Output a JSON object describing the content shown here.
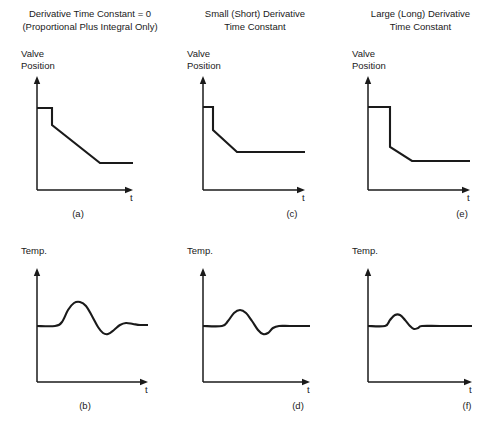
{
  "figure": {
    "caption_style": "control-system derivative action comparison",
    "columns": [
      {
        "id": "col-1",
        "title": "Derivative Time Constant = 0\n(Proportional Plus Integral Only)",
        "title_x": 10,
        "title_y": 8,
        "title_w": 160,
        "panels": [
          "a",
          "b"
        ]
      },
      {
        "id": "col-2",
        "title": "Small (Short) Derivative\nTime Constant",
        "title_x": 185,
        "title_y": 8,
        "title_w": 140,
        "panels": [
          "c",
          "d"
        ]
      },
      {
        "id": "col-3",
        "title": "Large (Long) Derivative\nTime Constant",
        "title_x": 348,
        "title_y": 8,
        "title_w": 145,
        "panels": [
          "e",
          "f"
        ]
      }
    ],
    "y_axis_labels": {
      "valve": "Valve\nPosition",
      "temp": "Temp."
    },
    "x_axis_label": "t",
    "panel_labels": {
      "a": "(a)",
      "b": "(b)",
      "c": "(c)",
      "d": "(d)",
      "e": "(e)",
      "f": "(f)"
    }
  },
  "chart_data": {
    "type": "line",
    "xlabel": "t",
    "grid": false,
    "legend": false,
    "panels": [
      {
        "key": "a",
        "label": "(a)",
        "column": 1,
        "row": 1,
        "ylabel": "Valve Position",
        "description": "Step then linear ramp down to new steady level (proportional plus integral only)",
        "origin": [
          37,
          190
        ],
        "y_axis_top": 76,
        "x_axis_right": 133,
        "points": [
          [
            37,
            108
          ],
          [
            52,
            108
          ],
          [
            52,
            125
          ],
          [
            100,
            163
          ],
          [
            133,
            163
          ]
        ]
      },
      {
        "key": "b",
        "label": "(b)",
        "column": 1,
        "row": 2,
        "ylabel": "Temp.",
        "description": "Large damped oscillation with pronounced overshoot and visible second cycle",
        "origin": [
          37,
          382
        ],
        "y_axis_top": 268,
        "x_axis_right": 148,
        "baseline_y": 326,
        "points": [
          [
            37,
            326
          ],
          [
            55,
            326
          ],
          [
            62,
            322
          ],
          [
            68,
            310
          ],
          [
            74,
            303
          ],
          [
            80,
            302
          ],
          [
            86,
            306
          ],
          [
            92,
            316
          ],
          [
            98,
            327
          ],
          [
            103,
            333
          ],
          [
            108,
            334
          ],
          [
            114,
            330
          ],
          [
            120,
            325
          ],
          [
            126,
            323
          ],
          [
            133,
            324
          ],
          [
            140,
            325
          ],
          [
            148,
            325
          ]
        ]
      },
      {
        "key": "c",
        "label": "(c)",
        "column": 2,
        "row": 1,
        "ylabel": "Valve Position",
        "description": "Step with steeper initial derivative kick then ramp to steady level",
        "origin": [
          203,
          190
        ],
        "y_axis_top": 76,
        "x_axis_right": 305,
        "points": [
          [
            203,
            107
          ],
          [
            213,
            107
          ],
          [
            213,
            130
          ],
          [
            237,
            152
          ],
          [
            305,
            152
          ]
        ]
      },
      {
        "key": "d",
        "label": "(d)",
        "column": 2,
        "row": 2,
        "ylabel": "Temp.",
        "description": "Moderate damped oscillation, smaller overshoot, settles quickly",
        "origin": [
          203,
          382
        ],
        "y_axis_top": 268,
        "x_axis_right": 310,
        "baseline_y": 326,
        "points": [
          [
            203,
            326
          ],
          [
            222,
            326
          ],
          [
            228,
            321
          ],
          [
            234,
            313
          ],
          [
            240,
            310
          ],
          [
            246,
            313
          ],
          [
            252,
            321
          ],
          [
            258,
            330
          ],
          [
            263,
            334
          ],
          [
            268,
            333
          ],
          [
            273,
            328
          ],
          [
            279,
            326
          ],
          [
            290,
            326
          ],
          [
            310,
            326
          ]
        ]
      },
      {
        "key": "e",
        "label": "(e)",
        "column": 3,
        "row": 1,
        "ylabel": "Valve Position",
        "description": "Very steep derivative spike drop, then short ramp to steady level",
        "origin": [
          368,
          190
        ],
        "y_axis_top": 76,
        "x_axis_right": 470,
        "points": [
          [
            368,
            107
          ],
          [
            390,
            107
          ],
          [
            390,
            147
          ],
          [
            412,
            161
          ],
          [
            470,
            161
          ]
        ]
      },
      {
        "key": "f",
        "label": "(f)",
        "column": 3,
        "row": 2,
        "ylabel": "Temp.",
        "description": "Minimal overshoot, single small bump, rapid settling to setpoint",
        "origin": [
          368,
          382
        ],
        "y_axis_top": 268,
        "x_axis_right": 472,
        "baseline_y": 326,
        "points": [
          [
            368,
            326
          ],
          [
            385,
            326
          ],
          [
            390,
            320
          ],
          [
            395,
            315
          ],
          [
            400,
            315
          ],
          [
            405,
            320
          ],
          [
            410,
            326
          ],
          [
            414,
            329
          ],
          [
            418,
            328
          ],
          [
            422,
            326
          ],
          [
            440,
            326
          ],
          [
            472,
            326
          ]
        ]
      }
    ]
  },
  "colors": {
    "curve": "#1a1a1a",
    "axis": "#1a1a1a",
    "background": "#ffffff",
    "text": "#1a1a1a"
  }
}
